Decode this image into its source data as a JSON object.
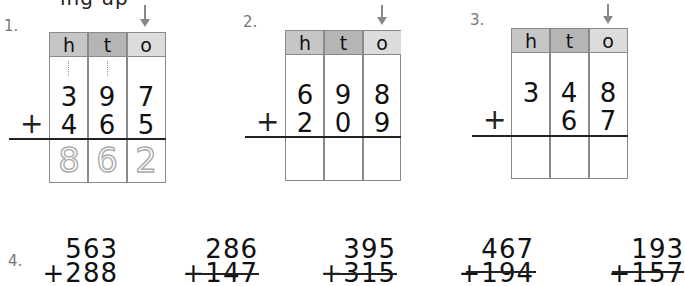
{
  "heading_fragment": "ing up",
  "colors": {
    "grid_border": "#8a8a8a",
    "header_h": "#c6c6c6",
    "header_t": "#b5b5b5",
    "header_o": "#dcdcdc",
    "arrow": "#888888",
    "traced_digits": "#aaaaaa"
  },
  "table_headers": [
    "h",
    "t",
    "o"
  ],
  "grid_problems": [
    {
      "label": "1.",
      "top": [
        "3",
        "9",
        "7"
      ],
      "bottom": [
        "4",
        "6",
        "5"
      ],
      "operator": "+",
      "answer": [
        "8",
        "6",
        "2"
      ],
      "answer_style": "dotted-trace",
      "carry_marks": [
        "h",
        "t"
      ]
    },
    {
      "label": "2.",
      "top": [
        "6",
        "9",
        "8"
      ],
      "bottom": [
        "2",
        "0",
        "9"
      ],
      "operator": "+",
      "answer": [
        "",
        "",
        ""
      ]
    },
    {
      "label": "3.",
      "top": [
        "3",
        "4",
        "8"
      ],
      "bottom": [
        "",
        "6",
        "7"
      ],
      "operator": "+",
      "answer": [
        "",
        "",
        ""
      ]
    }
  ],
  "row4": {
    "label": "4.",
    "problems": [
      {
        "top": "563",
        "bottom": "+288"
      },
      {
        "top": "286",
        "bottom": "+147"
      },
      {
        "top": "395",
        "bottom": "+315"
      },
      {
        "top": "467",
        "bottom": "+194"
      },
      {
        "top": "193",
        "bottom": "+157"
      }
    ]
  }
}
